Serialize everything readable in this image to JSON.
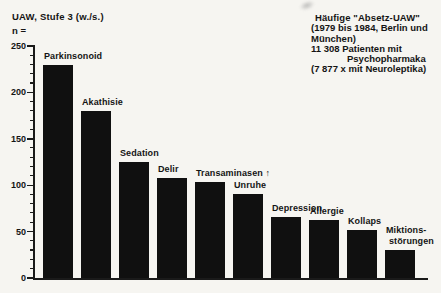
{
  "page": {
    "background": "#f6f5f1",
    "ink": "#141414",
    "bar_color": "#101010"
  },
  "header": {
    "title": "UAW, Stufe 3 (w./s.)",
    "count_label": "n ="
  },
  "info_block": {
    "heading": "Häufige \"Absetz-UAW\"",
    "lines": [
      "(1979 bis 1984, Berlin und",
      "München)",
      "11 308 Patienten mit",
      "Psychopharmaka",
      "(7 877 x mit Neuroleptika)"
    ]
  },
  "chart_data": {
    "type": "bar",
    "title": "UAW, Stufe 3 (w./s.)",
    "ylabel": "n =",
    "xlabel": "",
    "ylim": [
      0,
      250
    ],
    "yticks": [
      0,
      50,
      100,
      150,
      200,
      250
    ],
    "minor_tick_step": 10,
    "grid": false,
    "legend": false,
    "bar_color": "#101010",
    "categories": [
      "Parkinsonoid",
      "Akathisie",
      "Sedation",
      "Delir",
      "Transaminasen ↑",
      "Unruhe",
      "Depression",
      "Allergie",
      "Kollaps",
      "Miktionsstörungen"
    ],
    "values": [
      230,
      180,
      125,
      108,
      103,
      90,
      66,
      62,
      52,
      30
    ],
    "bar_labels": [
      [
        "Parkinsonoid"
      ],
      [
        "Akathisie"
      ],
      [
        "Sedation"
      ],
      [
        "Delir"
      ],
      [
        "Transaminasen ↑"
      ],
      [
        "Unruhe"
      ],
      [
        "Depression"
      ],
      [
        "Allergie"
      ],
      [
        "Kollaps"
      ],
      [
        "Miktions-",
        "störungen"
      ]
    ],
    "annotation": "Häufige \"Absetz-UAW\" (1979 bis 1984, Berlin und München), 11 308 Patienten mit Psychopharmaka (7 877 x mit Neuroleptika)"
  }
}
